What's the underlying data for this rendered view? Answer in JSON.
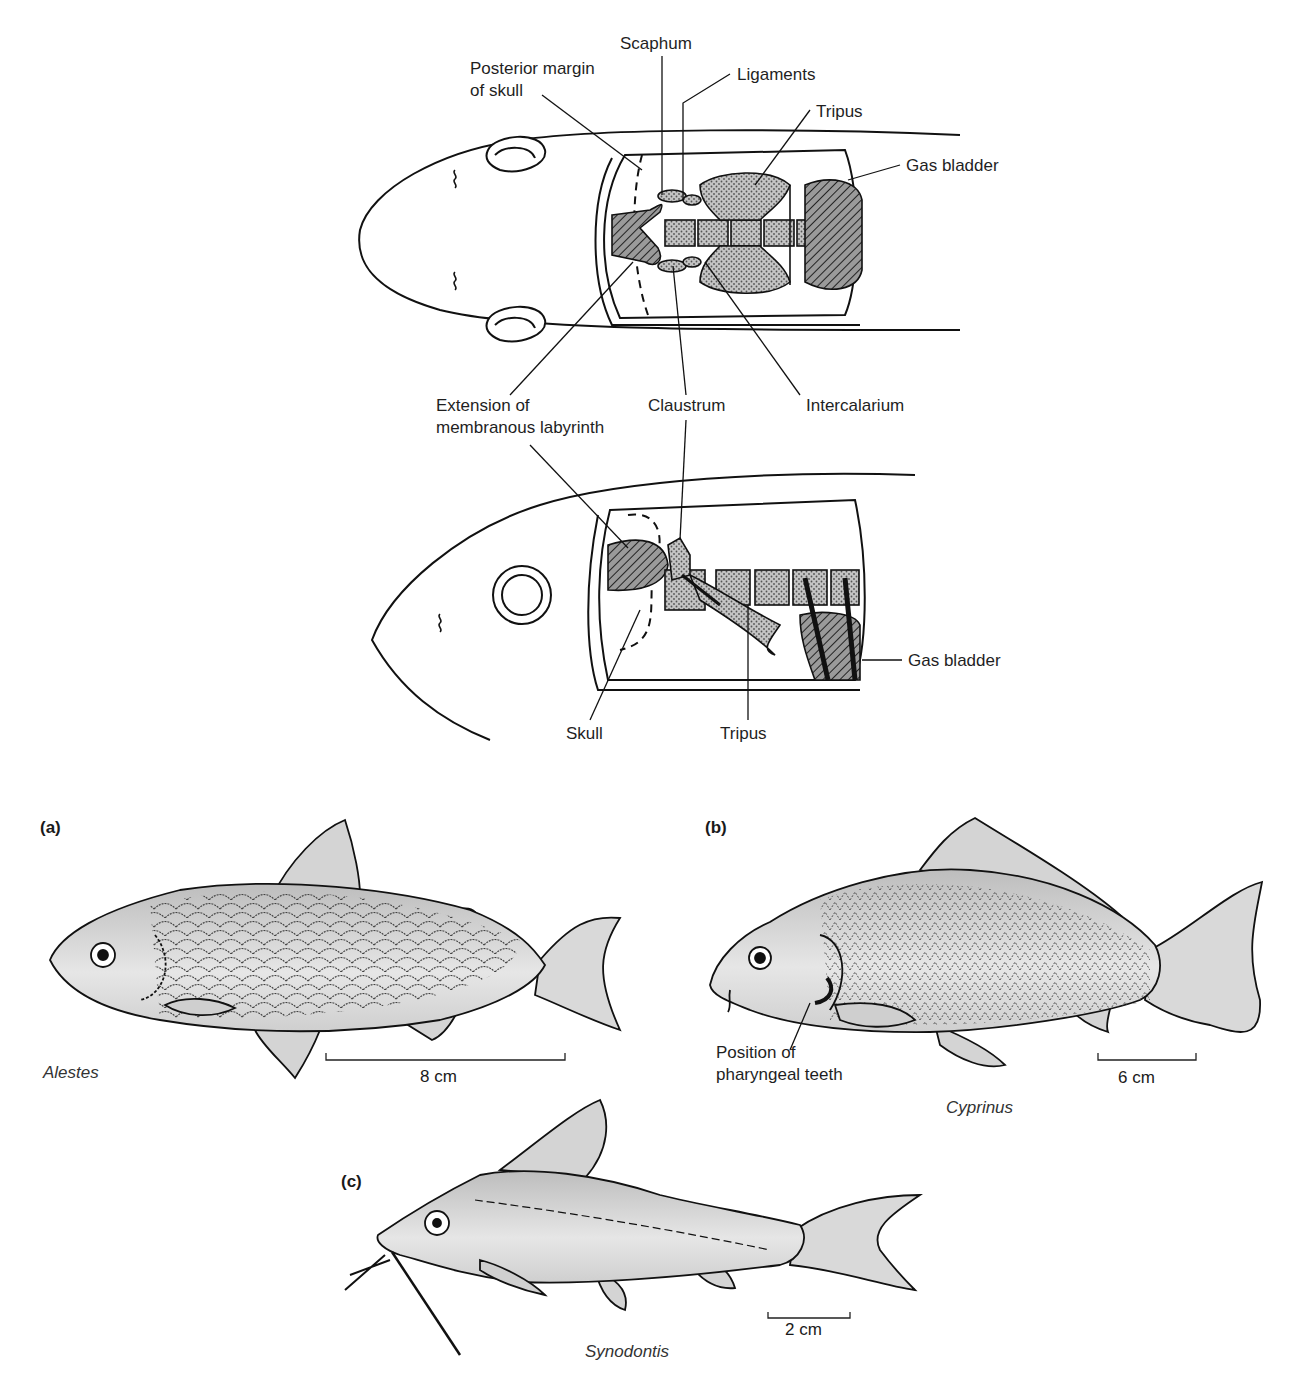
{
  "figure": {
    "weberian_dorsal_view": {
      "labels": {
        "scaphum": "Scaphum",
        "posterior_margin_line1": "Posterior margin",
        "posterior_margin_line2": "of skull",
        "ligaments": "Ligaments",
        "tripus": "Tripus",
        "gas_bladder": "Gas bladder",
        "extension_line1": "Extension of",
        "extension_line2": "membranous labyrinth",
        "claustrum": "Claustrum",
        "intercalarium": "Intercalarium"
      }
    },
    "weberian_lateral_view": {
      "labels": {
        "gas_bladder": "Gas bladder",
        "skull": "Skull",
        "tripus": "Tripus"
      }
    },
    "panels": [
      {
        "id": "a",
        "label": "(a)",
        "genus": "Alestes",
        "scale": "8 cm"
      },
      {
        "id": "b",
        "label": "(b)",
        "genus": "Cyprinus",
        "scale": "6 cm",
        "annotation_line1": "Position of",
        "annotation_line2": "pharyngeal teeth"
      },
      {
        "id": "c",
        "label": "(c)",
        "genus": "Synodontis",
        "scale": "2 cm"
      }
    ],
    "colors": {
      "ink": "#1a1a1a",
      "fish_fill": "#d9d9d9",
      "bone_fill": "#a8a8a8",
      "background": "#ffffff"
    }
  }
}
